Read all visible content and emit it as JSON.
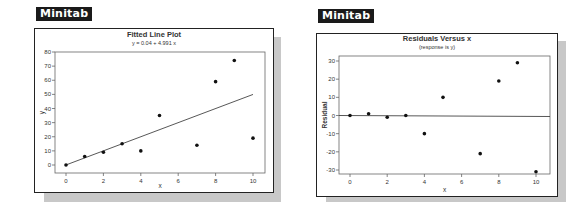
{
  "panels": [
    {
      "badge": "Minitab"
    },
    {
      "badge": "Minitab"
    }
  ],
  "chart_data": [
    {
      "type": "scatter",
      "title": "Fitted Line Plot",
      "subtitle": "y = 0.04 + 4.991 x",
      "xlabel": "x",
      "ylabel": "y",
      "xlim": [
        0,
        10
      ],
      "ylim": [
        0,
        80
      ],
      "xticks": [
        0,
        2,
        4,
        6,
        8,
        10
      ],
      "yticks": [
        0,
        10,
        20,
        30,
        40,
        50,
        60,
        70,
        80
      ],
      "grid": false,
      "legend": null,
      "series": [
        {
          "name": "data",
          "x": [
            0,
            1,
            2,
            3,
            4,
            5,
            7,
            8,
            9,
            10
          ],
          "y": [
            0,
            6,
            9,
            15,
            10,
            35,
            14,
            59,
            74,
            19
          ]
        }
      ],
      "fit_line": {
        "intercept": 0.04,
        "slope": 4.991,
        "x_range": [
          0,
          10
        ]
      }
    },
    {
      "type": "scatter",
      "title": "Residuals Versus x",
      "subtitle": "(response is y)",
      "xlabel": "x",
      "ylabel": "Residual",
      "xlim": [
        0,
        10
      ],
      "ylim": [
        -30,
        30
      ],
      "xticks": [
        0,
        2,
        4,
        6,
        8,
        10
      ],
      "yticks": [
        -30,
        -20,
        -10,
        0,
        10,
        20,
        30
      ],
      "grid": false,
      "legend": null,
      "reference_line": 0,
      "series": [
        {
          "name": "residuals",
          "x": [
            0,
            1,
            2,
            3,
            4,
            5,
            7,
            8,
            9,
            10
          ],
          "y": [
            0,
            1,
            -1,
            0,
            -10,
            10,
            -21,
            19,
            29,
            -31
          ]
        }
      ]
    }
  ]
}
